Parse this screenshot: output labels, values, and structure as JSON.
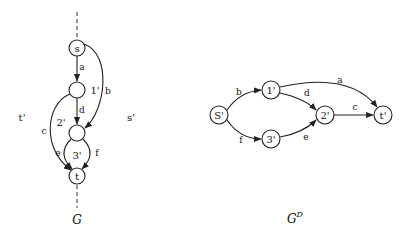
{
  "left_graph": {
    "caption": "G",
    "nodes": {
      "s": "s",
      "n1_label": "1'",
      "n2_label": "2'",
      "n3_label": "3'",
      "t": "t"
    },
    "face_labels": {
      "t_prime": "t'",
      "s_prime": "s'"
    },
    "edges": {
      "a": "a",
      "b": "b",
      "c": "c",
      "d": "d",
      "e": "e",
      "f": "f"
    }
  },
  "right_graph": {
    "caption_base": "G",
    "caption_sup": "D",
    "nodes": {
      "s": "S'",
      "n1": "1'",
      "n2": "2'",
      "n3": "3'",
      "t": "t'"
    },
    "edges": {
      "a": "a",
      "b": "b",
      "c": "c",
      "d": "d",
      "e": "e",
      "f": "f"
    }
  }
}
